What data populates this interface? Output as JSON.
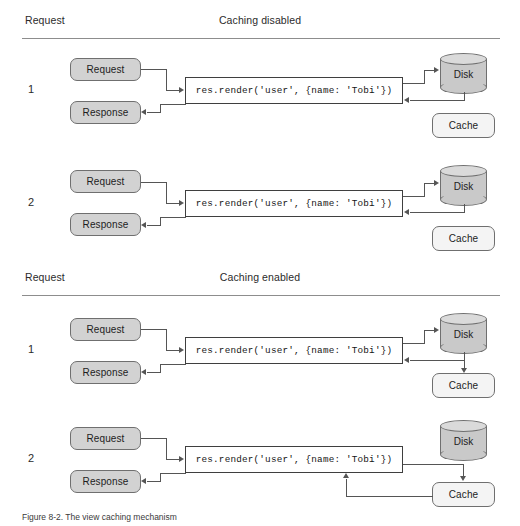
{
  "figure": {
    "caption": "Figure 8-2. The view caching mechanism"
  },
  "colors": {
    "box_fill_dark": "#d2d2d2",
    "box_fill_light": "#f4f4f4",
    "disk_fill": "#c9c9c9",
    "code_border": "#3f3f3f",
    "connector": "#555555",
    "rule": "#8d8d8d"
  },
  "code_snippet": "res.render('user', {name: 'Tobi'})",
  "labels": {
    "request": "Request",
    "response": "Response",
    "disk": "Disk",
    "cache": "Cache",
    "column_left": "Request"
  },
  "sections": [
    {
      "id": "caching-disabled",
      "left_header": "Request",
      "title": "Caching disabled",
      "rows": [
        {
          "number": "1",
          "request": "Request",
          "response": "Response",
          "code": "res.render('user', {name: 'Tobi'})",
          "disk": "Disk",
          "cache": "Cache",
          "flow": [
            "request->code",
            "code->disk",
            "disk->code",
            "code->response"
          ],
          "cache_connected": false
        },
        {
          "number": "2",
          "request": "Request",
          "response": "Response",
          "code": "res.render('user', {name: 'Tobi'})",
          "disk": "Disk",
          "cache": "Cache",
          "flow": [
            "request->code",
            "code->disk",
            "disk->code",
            "code->response"
          ],
          "cache_connected": false
        }
      ]
    },
    {
      "id": "caching-enabled",
      "left_header": "Request",
      "title": "Caching enabled",
      "rows": [
        {
          "number": "1",
          "request": "Request",
          "response": "Response",
          "code": "res.render('user', {name: 'Tobi'})",
          "disk": "Disk",
          "cache": "Cache",
          "flow": [
            "request->code",
            "code->disk",
            "disk->code",
            "disk->cache",
            "code->response"
          ],
          "cache_connected": true
        },
        {
          "number": "2",
          "request": "Request",
          "response": "Response",
          "code": "res.render('user', {name: 'Tobi'})",
          "disk": "Disk",
          "cache": "Cache",
          "flow": [
            "request->code",
            "code->cache",
            "cache->code",
            "code->response"
          ],
          "cache_connected": true
        }
      ]
    }
  ]
}
